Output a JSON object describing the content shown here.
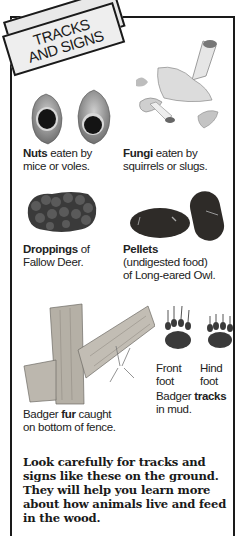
{
  "title": {
    "line1": "TRACKS",
    "line2": "AND SIGNS"
  },
  "signs": [
    {
      "bold": "Nuts",
      "rest1": " eaten by",
      "rest2": "mice or voles."
    },
    {
      "bold": "Fungi",
      "rest1": " eaten by",
      "rest2": "squirrels or slugs."
    },
    {
      "bold": "Droppings",
      "rest1": " of",
      "rest2": "Fallow Deer."
    },
    {
      "bold": "Pellets",
      "rest1": "",
      "rest2": "(undigested food)",
      "rest3": "of Long-eared Owl."
    },
    {
      "pre": "Badger ",
      "bold": "fur",
      "rest1": " caught",
      "rest2": "on bottom of fence."
    },
    {
      "pre": "Badger ",
      "bold": "tracks",
      "rest1": "",
      "rest2": "in mud."
    }
  ],
  "feet": {
    "front_line1": "Front",
    "front_line2": "foot",
    "hind_line1": "Hind",
    "hind_line2": "foot"
  },
  "body": "Look carefully for tracks and signs like these on the ground. They will help you learn more about how animals live and feed in the wood.",
  "colors": {
    "ink": "#1a1a1a",
    "banner": "#eeeeee",
    "dropping": "#3a3a3a",
    "pellet": "#2e2b28",
    "wood": "#b5b0a6"
  }
}
